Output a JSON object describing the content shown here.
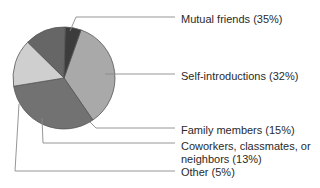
{
  "chart_data": {
    "type": "pie",
    "title": "",
    "center": [
      64,
      78
    ],
    "radius": 51,
    "start_angle_deg": -70.5,
    "direction": "clockwise",
    "legend_position": "right (callout labels with leader lines)",
    "slices": [
      {
        "name": "Mutual friends",
        "value": 35,
        "label": "Mutual friends (35%)",
        "color": "#a9a9a9"
      },
      {
        "name": "Self-introductions",
        "value": 32,
        "label": "Self-introductions (32%)",
        "color": "#727272"
      },
      {
        "name": "Family members",
        "value": 15,
        "label": "Family members (15%)",
        "color": "#cfcfcf"
      },
      {
        "name": "Coworkers, classmates, or neighbors",
        "value": 13,
        "label": "Coworkers, classmates, or neighbors (13%)",
        "label_lines": [
          "Coworkers, classmates, or",
          "neighbors (13%)"
        ],
        "color": "#666666"
      },
      {
        "name": "Other",
        "value": 5,
        "label": "Other (5%)",
        "color": "#3c3c3c"
      }
    ]
  },
  "labels": {
    "mutual": "Mutual friends (35%)",
    "self": "Self-introductions (32%)",
    "family": "Family members (15%)",
    "coworkers_line1": "Coworkers, classmates, or",
    "coworkers_line2": "neighbors (13%)",
    "other": "Other (5%)"
  },
  "leaders": [
    {
      "slice": "Mutual friends",
      "points": [
        [
          70,
          31
        ],
        [
          76,
          17
        ],
        [
          175,
          17
        ]
      ]
    },
    {
      "slice": "Self-introductions",
      "points": [
        [
          105,
          74
        ],
        [
          175,
          74
        ]
      ]
    },
    {
      "slice": "Family members",
      "points": [
        [
          90,
          122
        ],
        [
          96,
          128
        ],
        [
          175,
          128
        ]
      ]
    },
    {
      "slice": "Coworkers, classmates, or neighbors",
      "points": [
        [
          42,
          118
        ],
        [
          43,
          143
        ],
        [
          175,
          143
        ]
      ]
    },
    {
      "slice": "Other",
      "points": [
        [
          19,
          104
        ],
        [
          15,
          171
        ],
        [
          175,
          171
        ]
      ]
    }
  ],
  "style": {
    "leader_color": "#8a8a8a",
    "outline_color": "#555555"
  }
}
